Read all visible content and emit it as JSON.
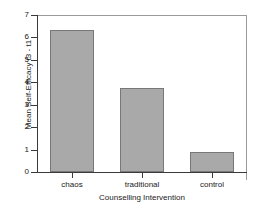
{
  "chart_data": {
    "type": "bar",
    "title": "",
    "categories": [
      "chaos",
      "traditional",
      "control"
    ],
    "values": [
      6.35,
      3.75,
      0.88
    ],
    "xlabel": "Counselling Intervention",
    "ylabel": "Mean Self-Efficacy t3 - t1",
    "ylim": [
      0,
      7
    ],
    "yticks": [
      0,
      1,
      2,
      3,
      4,
      5,
      6,
      7
    ],
    "ytick_labels": [
      "0",
      "1",
      "2",
      "3",
      "4",
      "5",
      "6",
      "7"
    ],
    "grid": false,
    "legend": null,
    "bar_color": "#a9a9a9",
    "bar_edge_color": "#787878",
    "axis_color": "#3a3a3a",
    "frame_color": "#9a9a9a",
    "background": "#ffffff"
  }
}
